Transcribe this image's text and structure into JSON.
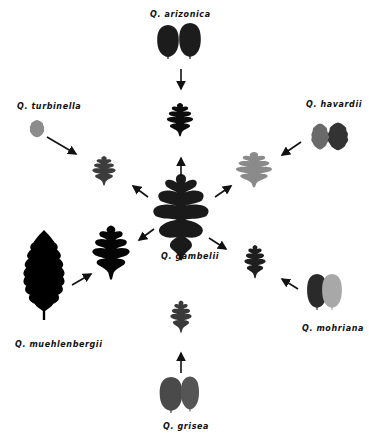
{
  "center": {
    "label": "Q. gambelii",
    "color": "#1a1a1a"
  },
  "species": [
    {
      "id": "arizonica",
      "label": "Q. arizonica",
      "parent_colors": [
        "#1c1c1c",
        "#1c1c1c"
      ],
      "hybrid_color": "#0d0d0d"
    },
    {
      "id": "havardii",
      "label": "Q. havardii",
      "parent_colors": [
        "#6a6a6a",
        "#333333"
      ],
      "hybrid_color": "#8a8a8a"
    },
    {
      "id": "mohriana",
      "label": "Q. mohriana",
      "parent_colors": [
        "#2a2a2a",
        "#a8a8a8"
      ],
      "hybrid_color": "#1e1e1e"
    },
    {
      "id": "grisea",
      "label": "Q. grisea",
      "parent_colors": [
        "#4a4a4a",
        "#555555"
      ],
      "hybrid_color": "#3a3a3a"
    },
    {
      "id": "muehlenbergii",
      "label": "Q. muehlenbergii",
      "parent_colors": [
        "#000000"
      ],
      "hybrid_color": "#050505"
    },
    {
      "id": "turbinella",
      "label": "Q. turbinella",
      "parent_colors": [
        "#8c8c8c"
      ],
      "hybrid_color": "#3c3c3c"
    }
  ]
}
